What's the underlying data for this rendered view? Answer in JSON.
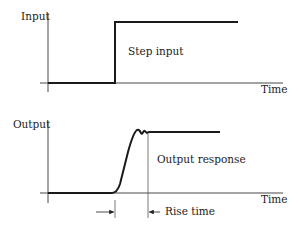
{
  "diagram": {
    "top_plot": {
      "y_label": "Input",
      "x_label": "Time",
      "curve_label": "Step input"
    },
    "bottom_plot": {
      "y_label": "Output",
      "x_label": "Time",
      "curve_label": "Output response",
      "annotation": "Rise time"
    },
    "colors": {
      "line": "#1a1a1a",
      "axis": "#333333",
      "background": "#ffffff"
    }
  }
}
